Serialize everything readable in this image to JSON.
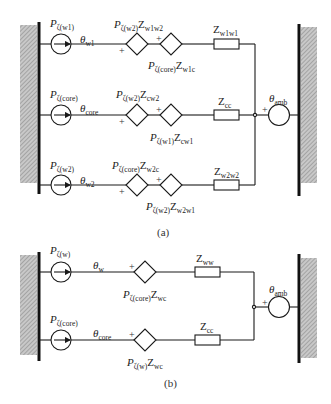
{
  "figure": {
    "panel_a": {
      "caption": "(a)",
      "rows": [
        {
          "source": {
            "P": "P",
            "sub": "ζ(w1)"
          },
          "node": {
            "theta": "θ",
            "sub": "w1"
          },
          "dep1": {
            "P": "P",
            "psub": "ζ(w2)",
            "Z": "Z",
            "zsub": "w1w2"
          },
          "dep2": {
            "P": "P",
            "psub": "ζ(core)",
            "Z": "Z",
            "zsub": "w1c"
          },
          "impedance": {
            "Z": "Z",
            "sub": "w1w1"
          }
        },
        {
          "source": {
            "P": "P",
            "sub": "ζ(core)"
          },
          "node": {
            "theta": "θ",
            "sub": "core"
          },
          "dep1": {
            "P": "P",
            "psub": "ζ(w2)",
            "Z": "Z",
            "zsub": "cw2"
          },
          "dep2": {
            "P": "P",
            "psub": "ζ(w1)",
            "Z": "Z",
            "zsub": "cw1"
          },
          "impedance": {
            "Z": "Z",
            "sub": "cc"
          }
        },
        {
          "source": {
            "P": "P",
            "sub": "ζ(w2)"
          },
          "node": {
            "theta": "θ",
            "sub": "w2"
          },
          "dep1": {
            "P": "P",
            "psub": "ζ(core)",
            "Z": "Z",
            "zsub": "w2c"
          },
          "dep2": {
            "P": "P",
            "psub": "ζ(w2)",
            "Z": "Z",
            "zsub": "w2w1"
          },
          "impedance": {
            "Z": "Z",
            "sub": "w2w2"
          }
        }
      ],
      "ambient": {
        "theta": "θ",
        "sub": "amb"
      }
    },
    "panel_b": {
      "caption": "(b)",
      "rows": [
        {
          "source": {
            "P": "P",
            "sub": "ζ(w)"
          },
          "node": {
            "theta": "θ",
            "sub": "w"
          },
          "dep": {
            "P": "P",
            "psub": "ζ(core)",
            "Z": "Z",
            "zsub": "wc"
          },
          "impedance": {
            "Z": "Z",
            "sub": "ww"
          }
        },
        {
          "source": {
            "P": "P",
            "sub": "ζ(core)"
          },
          "node": {
            "theta": "θ",
            "sub": "core"
          },
          "dep": {
            "P": "P",
            "psub": "ζ(w)",
            "Z": "Z",
            "zsub": "wc"
          },
          "impedance": {
            "Z": "Z",
            "sub": "cc"
          }
        }
      ],
      "ambient": {
        "theta": "θ",
        "sub": "amb"
      }
    },
    "plus_sign": "+",
    "colors": {
      "line": "#1a1a1a",
      "hatch": "#9a9a9a"
    }
  }
}
